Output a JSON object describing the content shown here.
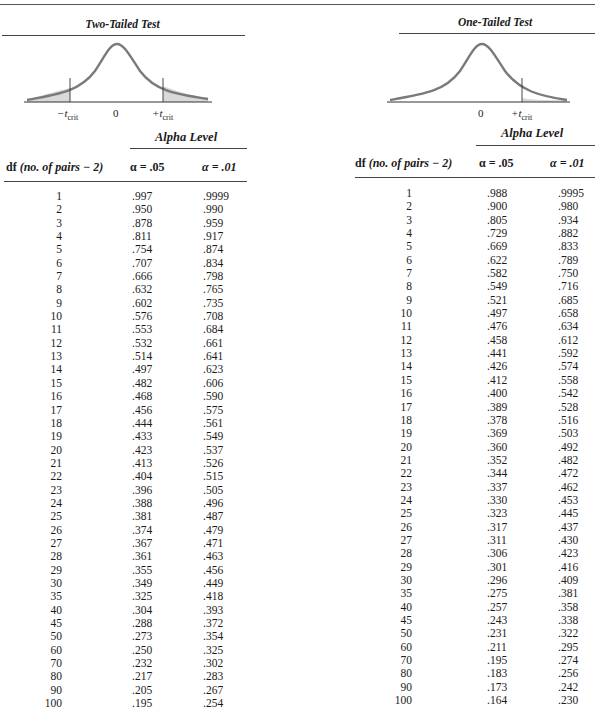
{
  "two_tailed": {
    "title": "Two-Tailed Test",
    "axis": {
      "neg_crit": "−t",
      "neg_crit_sub": "crit",
      "zero": "0",
      "pos_crit": "+t",
      "pos_crit_sub": "crit"
    },
    "alpha_level_label": "Alpha Level",
    "headers": {
      "df": "df",
      "df_note": "(no. of pairs − 2)",
      "alpha05": "α = .05",
      "alpha01": "α = .01"
    },
    "rows": [
      [
        "1",
        ".997",
        ".9999"
      ],
      [
        "2",
        ".950",
        ".990"
      ],
      [
        "3",
        ".878",
        ".959"
      ],
      [
        "4",
        ".811",
        ".917"
      ],
      [
        "5",
        ".754",
        ".874"
      ],
      [
        "6",
        ".707",
        ".834"
      ],
      [
        "7",
        ".666",
        ".798"
      ],
      [
        "8",
        ".632",
        ".765"
      ],
      [
        "9",
        ".602",
        ".735"
      ],
      [
        "10",
        ".576",
        ".708"
      ],
      [
        "11",
        ".553",
        ".684"
      ],
      [
        "12",
        ".532",
        ".661"
      ],
      [
        "13",
        ".514",
        ".641"
      ],
      [
        "14",
        ".497",
        ".623"
      ],
      [
        "15",
        ".482",
        ".606"
      ],
      [
        "16",
        ".468",
        ".590"
      ],
      [
        "17",
        ".456",
        ".575"
      ],
      [
        "18",
        ".444",
        ".561"
      ],
      [
        "19",
        ".433",
        ".549"
      ],
      [
        "20",
        ".423",
        ".537"
      ],
      [
        "21",
        ".413",
        ".526"
      ],
      [
        "22",
        ".404",
        ".515"
      ],
      [
        "23",
        ".396",
        ".505"
      ],
      [
        "24",
        ".388",
        ".496"
      ],
      [
        "25",
        ".381",
        ".487"
      ],
      [
        "26",
        ".374",
        ".479"
      ],
      [
        "27",
        ".367",
        ".471"
      ],
      [
        "28",
        ".361",
        ".463"
      ],
      [
        "29",
        ".355",
        ".456"
      ],
      [
        "30",
        ".349",
        ".449"
      ],
      [
        "35",
        ".325",
        ".418"
      ],
      [
        "40",
        ".304",
        ".393"
      ],
      [
        "45",
        ".288",
        ".372"
      ],
      [
        "50",
        ".273",
        ".354"
      ],
      [
        "60",
        ".250",
        ".325"
      ],
      [
        "70",
        ".232",
        ".302"
      ],
      [
        "80",
        ".217",
        ".283"
      ],
      [
        "90",
        ".205",
        ".267"
      ],
      [
        "100",
        ".195",
        ".254"
      ]
    ]
  },
  "one_tailed": {
    "title": "One-Tailed Test",
    "axis": {
      "zero": "0",
      "pos_crit": "+t",
      "pos_crit_sub": "crit"
    },
    "alpha_level_label": "Alpha Level",
    "headers": {
      "df": "df",
      "df_note": "(no. of pairs − 2)",
      "alpha05": "α = .05",
      "alpha01": "α = .01"
    },
    "rows": [
      [
        "1",
        ".988",
        ".9995"
      ],
      [
        "2",
        ".900",
        ".980"
      ],
      [
        "3",
        ".805",
        ".934"
      ],
      [
        "4",
        ".729",
        ".882"
      ],
      [
        "5",
        ".669",
        ".833"
      ],
      [
        "6",
        ".622",
        ".789"
      ],
      [
        "7",
        ".582",
        ".750"
      ],
      [
        "8",
        ".549",
        ".716"
      ],
      [
        "9",
        ".521",
        ".685"
      ],
      [
        "10",
        ".497",
        ".658"
      ],
      [
        "11",
        ".476",
        ".634"
      ],
      [
        "12",
        ".458",
        ".612"
      ],
      [
        "13",
        ".441",
        ".592"
      ],
      [
        "14",
        ".426",
        ".574"
      ],
      [
        "15",
        ".412",
        ".558"
      ],
      [
        "16",
        ".400",
        ".542"
      ],
      [
        "17",
        ".389",
        ".528"
      ],
      [
        "18",
        ".378",
        ".516"
      ],
      [
        "19",
        ".369",
        ".503"
      ],
      [
        "20",
        ".360",
        ".492"
      ],
      [
        "21",
        ".352",
        ".482"
      ],
      [
        "22",
        ".344",
        ".472"
      ],
      [
        "23",
        ".337",
        ".462"
      ],
      [
        "24",
        ".330",
        ".453"
      ],
      [
        "25",
        ".323",
        ".445"
      ],
      [
        "26",
        ".317",
        ".437"
      ],
      [
        "27",
        ".311",
        ".430"
      ],
      [
        "28",
        ".306",
        ".423"
      ],
      [
        "29",
        ".301",
        ".416"
      ],
      [
        "30",
        ".296",
        ".409"
      ],
      [
        "35",
        ".275",
        ".381"
      ],
      [
        "40",
        ".257",
        ".358"
      ],
      [
        "45",
        ".243",
        ".338"
      ],
      [
        "50",
        ".231",
        ".322"
      ],
      [
        "60",
        ".211",
        ".295"
      ],
      [
        "70",
        ".195",
        ".274"
      ],
      [
        "80",
        ".183",
        ".256"
      ],
      [
        "90",
        ".173",
        ".242"
      ],
      [
        "100",
        ".164",
        ".230"
      ]
    ]
  },
  "colors": {
    "curve": "#7a7a7a",
    "shade": "#d9d9d9",
    "rule": "#444444"
  }
}
